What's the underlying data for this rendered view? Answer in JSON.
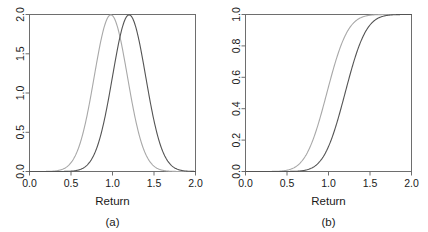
{
  "figure": {
    "panels": [
      {
        "id": "a",
        "caption": "(a)",
        "xlabel": "Return",
        "ylabel": "",
        "x_ticks": [
          "0.0",
          "0.5",
          "1.0",
          "1.5",
          "2.0"
        ],
        "y_ticks": [
          "0.0",
          "0.5",
          "1.0",
          "1.5",
          "2.0"
        ]
      },
      {
        "id": "b",
        "caption": "(b)",
        "xlabel": "Return",
        "ylabel": "",
        "x_ticks": [
          "0.0",
          "0.5",
          "1.0",
          "1.5",
          "2.0"
        ],
        "y_ticks": [
          "0.0",
          "0.2",
          "0.4",
          "0.6",
          "0.8",
          "1.0"
        ]
      }
    ]
  },
  "colors": {
    "series_light": "#a8a8a8",
    "series_dark": "#545454",
    "axis": "#6e6e6e",
    "text": "#1a1a1a",
    "background": "#ffffff"
  },
  "chart_data": [
    {
      "type": "line",
      "title": "",
      "subtitle": "(a)",
      "xlabel": "Return",
      "ylabel": "",
      "xlim": [
        0.0,
        2.0
      ],
      "ylim": [
        0.0,
        2.0
      ],
      "xticks": [
        0.0,
        0.5,
        1.0,
        1.5,
        2.0
      ],
      "yticks": [
        0.0,
        0.5,
        1.0,
        1.5,
        2.0
      ],
      "grid": false,
      "legend": "none",
      "description": "Probability density functions of two normal distributions of returns",
      "series": [
        {
          "name": "density-light",
          "color": "#a8a8a8",
          "distribution": "normal-pdf",
          "mean": 0.98,
          "sd": 0.2,
          "peak_x": 0.98,
          "peak_y": 1.99,
          "x": [
            0.0,
            0.2,
            0.4,
            0.5,
            0.6,
            0.7,
            0.78,
            0.88,
            0.98,
            1.08,
            1.18,
            1.28,
            1.38,
            1.48,
            1.6,
            1.8,
            2.0
          ],
          "y": [
            0.0,
            0.0,
            0.03,
            0.11,
            0.3,
            0.65,
            1.04,
            1.57,
            1.99,
            1.57,
            1.04,
            0.65,
            0.3,
            0.11,
            0.02,
            0.0,
            0.0
          ]
        },
        {
          "name": "density-dark",
          "color": "#545454",
          "distribution": "normal-pdf",
          "mean": 1.2,
          "sd": 0.2,
          "peak_x": 1.2,
          "peak_y": 1.99,
          "x": [
            0.0,
            0.2,
            0.4,
            0.6,
            0.72,
            0.82,
            0.92,
            1.0,
            1.1,
            1.2,
            1.3,
            1.4,
            1.5,
            1.6,
            1.7,
            1.82,
            2.0
          ],
          "y": [
            0.0,
            0.0,
            0.0,
            0.03,
            0.11,
            0.3,
            0.65,
            1.04,
            1.57,
            1.99,
            1.57,
            1.04,
            0.65,
            0.3,
            0.11,
            0.02,
            0.0
          ]
        }
      ]
    },
    {
      "type": "line",
      "title": "",
      "subtitle": "(b)",
      "xlabel": "Return",
      "ylabel": "",
      "xlim": [
        0.0,
        2.0
      ],
      "ylim": [
        0.0,
        1.0
      ],
      "xticks": [
        0.0,
        0.5,
        1.0,
        1.5,
        2.0
      ],
      "yticks": [
        0.0,
        0.2,
        0.4,
        0.6,
        0.8,
        1.0
      ],
      "grid": false,
      "legend": "none",
      "description": "Cumulative distribution functions corresponding to panel (a)",
      "series": [
        {
          "name": "cdf-light",
          "color": "#a8a8a8",
          "distribution": "normal-cdf",
          "mean": 0.98,
          "sd": 0.2,
          "median_x": 0.98,
          "x": [
            0.0,
            0.3,
            0.45,
            0.58,
            0.68,
            0.78,
            0.88,
            0.98,
            1.08,
            1.18,
            1.28,
            1.38,
            1.5,
            1.65,
            1.8,
            2.0
          ],
          "y": [
            0.0,
            0.0,
            0.01,
            0.02,
            0.07,
            0.16,
            0.31,
            0.5,
            0.69,
            0.84,
            0.93,
            0.98,
            0.99,
            1.0,
            1.0,
            1.0
          ]
        },
        {
          "name": "cdf-dark",
          "color": "#545454",
          "distribution": "normal-cdf",
          "mean": 1.2,
          "sd": 0.2,
          "median_x": 1.2,
          "x": [
            0.0,
            0.4,
            0.6,
            0.72,
            0.82,
            0.92,
            1.0,
            1.1,
            1.2,
            1.3,
            1.4,
            1.5,
            1.6,
            1.72,
            1.86,
            2.0
          ],
          "y": [
            0.0,
            0.0,
            0.0,
            0.01,
            0.03,
            0.08,
            0.16,
            0.31,
            0.5,
            0.69,
            0.84,
            0.93,
            0.98,
            0.99,
            1.0,
            1.0
          ]
        }
      ]
    }
  ]
}
